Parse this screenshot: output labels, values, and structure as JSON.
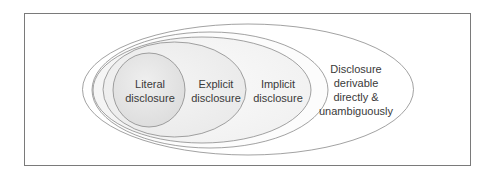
{
  "diagram": {
    "type": "nested-euler",
    "sets": [
      {
        "id": "outer",
        "lines": [
          "Disclosure",
          "derivable",
          "directly &",
          "unambiguously"
        ],
        "fill": "#ffffff"
      },
      {
        "id": "implicit",
        "lines": [
          "Implicit",
          "disclosure"
        ],
        "fill": "#f7f7f7"
      },
      {
        "id": "explicit",
        "lines": [
          "Explicit",
          "disclosure"
        ],
        "fill": "#f1f1f1"
      },
      {
        "id": "literal",
        "lines": [
          "Literal",
          "disclosure"
        ],
        "fill": "#e6e6e6"
      }
    ],
    "stroke_color": "#8a8a8a",
    "frame_color": "#7a7a7a"
  }
}
